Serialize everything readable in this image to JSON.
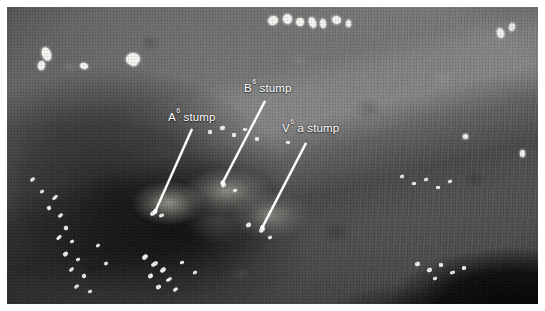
{
  "figure": {
    "kind": "intraoperative-thoracoscopic-photograph",
    "modality": "VATS endoscopic still image",
    "rendering": "grayscale halftone print scan",
    "border_color": "#ffffff",
    "annotation_color": "#ffffff"
  },
  "annotations": [
    {
      "id": "a6-stump",
      "prefix": "A",
      "superscript": "6",
      "suffix": " stump",
      "text": "A6 stump",
      "label_x": 168,
      "label_y": 112,
      "line_from_x": 192,
      "line_from_y": 128,
      "line_to_x": 155,
      "line_to_y": 211
    },
    {
      "id": "b6-stump",
      "prefix": "B",
      "superscript": "6",
      "suffix": " stump",
      "text": "B6 stump",
      "label_x": 244,
      "label_y": 83,
      "line_from_x": 265,
      "line_from_y": 100,
      "line_to_x": 222,
      "line_to_y": 183
    },
    {
      "id": "v6a-stump",
      "prefix": "V",
      "superscript": "6",
      "suffix": " a stump",
      "text": "V6 a stump",
      "label_x": 282,
      "label_y": 123,
      "line_from_x": 306,
      "line_from_y": 142,
      "line_to_x": 262,
      "line_to_y": 227
    }
  ],
  "specular_highlights": [
    {
      "x": 42,
      "y": 47,
      "w": 9,
      "h": 14,
      "r": -20
    },
    {
      "x": 38,
      "y": 61,
      "w": 7,
      "h": 9,
      "r": 10
    },
    {
      "x": 80,
      "y": 63,
      "w": 8,
      "h": 6,
      "r": 15
    },
    {
      "x": 126,
      "y": 53,
      "w": 14,
      "h": 12,
      "r": -10
    },
    {
      "x": 131,
      "y": 60,
      "w": 6,
      "h": 6,
      "r": 0
    },
    {
      "x": 268,
      "y": 16,
      "w": 10,
      "h": 9,
      "r": -25
    },
    {
      "x": 283,
      "y": 14,
      "w": 9,
      "h": 10,
      "r": -15
    },
    {
      "x": 296,
      "y": 18,
      "w": 8,
      "h": 8,
      "r": 10
    },
    {
      "x": 309,
      "y": 17,
      "w": 7,
      "h": 11,
      "r": -20
    },
    {
      "x": 320,
      "y": 19,
      "w": 6,
      "h": 9,
      "r": -5
    },
    {
      "x": 332,
      "y": 16,
      "w": 9,
      "h": 8,
      "r": 20
    },
    {
      "x": 346,
      "y": 20,
      "w": 5,
      "h": 7,
      "r": 0
    },
    {
      "x": 497,
      "y": 28,
      "w": 7,
      "h": 10,
      "r": -18
    },
    {
      "x": 509,
      "y": 23,
      "w": 6,
      "h": 8,
      "r": 12
    },
    {
      "x": 520,
      "y": 150,
      "w": 5,
      "h": 7,
      "r": 0
    },
    {
      "x": 463,
      "y": 134,
      "w": 5,
      "h": 5,
      "r": 0
    }
  ],
  "clip_glints": [
    {
      "x": 30,
      "y": 178,
      "w": 5,
      "h": 3,
      "r": -38
    },
    {
      "x": 40,
      "y": 190,
      "w": 4,
      "h": 3,
      "r": -30
    },
    {
      "x": 52,
      "y": 196,
      "w": 6,
      "h": 3,
      "r": -40
    },
    {
      "x": 47,
      "y": 206,
      "w": 4,
      "h": 4,
      "r": -20
    },
    {
      "x": 58,
      "y": 214,
      "w": 5,
      "h": 3,
      "r": -35
    },
    {
      "x": 64,
      "y": 226,
      "w": 4,
      "h": 4,
      "r": -25
    },
    {
      "x": 56,
      "y": 236,
      "w": 6,
      "h": 3,
      "r": -45
    },
    {
      "x": 70,
      "y": 240,
      "w": 4,
      "h": 3,
      "r": -30
    },
    {
      "x": 63,
      "y": 252,
      "w": 5,
      "h": 4,
      "r": -35
    },
    {
      "x": 76,
      "y": 258,
      "w": 4,
      "h": 3,
      "r": -20
    },
    {
      "x": 69,
      "y": 268,
      "w": 5,
      "h": 3,
      "r": -40
    },
    {
      "x": 82,
      "y": 274,
      "w": 4,
      "h": 4,
      "r": -28
    },
    {
      "x": 74,
      "y": 285,
      "w": 5,
      "h": 3,
      "r": -36
    },
    {
      "x": 88,
      "y": 290,
      "w": 4,
      "h": 3,
      "r": -22
    },
    {
      "x": 96,
      "y": 244,
      "w": 4,
      "h": 3,
      "r": -30
    },
    {
      "x": 104,
      "y": 262,
      "w": 4,
      "h": 3,
      "r": -25
    },
    {
      "x": 150,
      "y": 211,
      "w": 7,
      "h": 4,
      "r": -35
    },
    {
      "x": 159,
      "y": 214,
      "w": 5,
      "h": 3,
      "r": -25
    },
    {
      "x": 142,
      "y": 255,
      "w": 6,
      "h": 4,
      "r": -40
    },
    {
      "x": 151,
      "y": 262,
      "w": 7,
      "h": 4,
      "r": -32
    },
    {
      "x": 160,
      "y": 268,
      "w": 6,
      "h": 4,
      "r": -38
    },
    {
      "x": 148,
      "y": 274,
      "w": 5,
      "h": 4,
      "r": -28
    },
    {
      "x": 166,
      "y": 278,
      "w": 6,
      "h": 3,
      "r": -34
    },
    {
      "x": 156,
      "y": 285,
      "w": 5,
      "h": 4,
      "r": -26
    },
    {
      "x": 173,
      "y": 288,
      "w": 5,
      "h": 3,
      "r": -36
    },
    {
      "x": 180,
      "y": 261,
      "w": 4,
      "h": 3,
      "r": -20
    },
    {
      "x": 193,
      "y": 271,
      "w": 4,
      "h": 3,
      "r": -30
    },
    {
      "x": 221,
      "y": 183,
      "w": 5,
      "h": 4,
      "r": -30
    },
    {
      "x": 233,
      "y": 189,
      "w": 4,
      "h": 3,
      "r": -20
    },
    {
      "x": 246,
      "y": 223,
      "w": 5,
      "h": 4,
      "r": -30
    },
    {
      "x": 259,
      "y": 228,
      "w": 6,
      "h": 4,
      "r": -35
    },
    {
      "x": 268,
      "y": 236,
      "w": 4,
      "h": 3,
      "r": -25
    },
    {
      "x": 208,
      "y": 130,
      "w": 4,
      "h": 4,
      "r": 0
    },
    {
      "x": 220,
      "y": 126,
      "w": 5,
      "h": 4,
      "r": -15
    },
    {
      "x": 232,
      "y": 133,
      "w": 4,
      "h": 4,
      "r": 10
    },
    {
      "x": 243,
      "y": 128,
      "w": 4,
      "h": 3,
      "r": 0
    },
    {
      "x": 255,
      "y": 137,
      "w": 4,
      "h": 4,
      "r": -10
    },
    {
      "x": 286,
      "y": 141,
      "w": 4,
      "h": 3,
      "r": 0
    },
    {
      "x": 400,
      "y": 175,
      "w": 4,
      "h": 3,
      "r": -18
    },
    {
      "x": 412,
      "y": 182,
      "w": 4,
      "h": 3,
      "r": -12
    },
    {
      "x": 424,
      "y": 178,
      "w": 4,
      "h": 3,
      "r": -22
    },
    {
      "x": 436,
      "y": 186,
      "w": 4,
      "h": 3,
      "r": -10
    },
    {
      "x": 448,
      "y": 180,
      "w": 4,
      "h": 3,
      "r": -20
    },
    {
      "x": 415,
      "y": 262,
      "w": 5,
      "h": 4,
      "r": -15
    },
    {
      "x": 427,
      "y": 268,
      "w": 5,
      "h": 4,
      "r": -22
    },
    {
      "x": 439,
      "y": 263,
      "w": 4,
      "h": 4,
      "r": -10
    },
    {
      "x": 450,
      "y": 271,
      "w": 5,
      "h": 3,
      "r": -18
    },
    {
      "x": 462,
      "y": 266,
      "w": 4,
      "h": 4,
      "r": -12
    },
    {
      "x": 433,
      "y": 277,
      "w": 4,
      "h": 3,
      "r": -20
    }
  ]
}
